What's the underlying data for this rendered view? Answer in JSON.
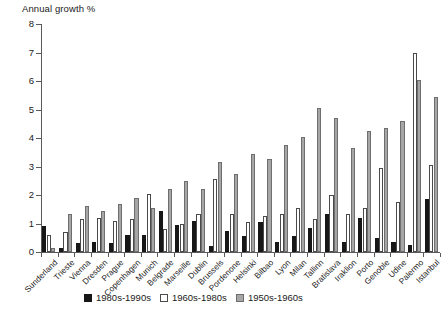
{
  "chart_data": {
    "type": "bar",
    "title": "",
    "ylabel": "Annual growth %",
    "xlabel": "",
    "ylim": [
      0,
      8
    ],
    "yticks": [
      0,
      1,
      2,
      3,
      4,
      5,
      6,
      7,
      8
    ],
    "grid": false,
    "legend_position": "bottom-center",
    "categories": [
      "Sunderland",
      "Trieste",
      "Vienna",
      "Dresden",
      "Prague",
      "Copenhagen",
      "Munich",
      "Belgrade",
      "Marseille",
      "Dublin",
      "Brussels",
      "Pordenone",
      "Helsinki",
      "Bilbao",
      "Lyon",
      "Milan",
      "Tallinn",
      "Bratislava",
      "Iraklion",
      "Porto",
      "Genoble",
      "Udine",
      "Palermo",
      "Istanbul"
    ],
    "series": [
      {
        "name": "1980s-1990s",
        "color": "#171717",
        "values": [
          0.9,
          0.15,
          0.3,
          0.35,
          0.3,
          0.6,
          0.6,
          1.45,
          0.95,
          1.1,
          0.2,
          0.75,
          0.55,
          1.05,
          0.35,
          0.55,
          0.85,
          1.35,
          0.35,
          1.2,
          0.5,
          0.35,
          0.25,
          1.85
        ]
      },
      {
        "name": "1960s-1980s",
        "color": "#ffffff",
        "values": [
          0.6,
          0.7,
          1.15,
          1.2,
          1.1,
          1.15,
          2.05,
          0.8,
          1.0,
          1.35,
          2.55,
          1.35,
          1.05,
          1.25,
          1.35,
          1.55,
          1.15,
          2.0,
          1.35,
          1.55,
          2.95,
          1.75,
          7.0,
          3.05
        ]
      },
      {
        "name": "1950s-1960s",
        "color": "#a6a6a6",
        "values": [
          0.15,
          1.35,
          1.6,
          1.45,
          1.7,
          1.9,
          1.55,
          2.2,
          2.5,
          2.2,
          3.15,
          2.75,
          3.45,
          3.25,
          3.75,
          4.05,
          5.05,
          4.7,
          3.65,
          4.25,
          4.35,
          4.6,
          6.05,
          5.45
        ]
      }
    ]
  },
  "legend": {
    "items": [
      {
        "label": "1980s-1990s",
        "swatch": "black-square-icon"
      },
      {
        "label": "1960s-1980s",
        "swatch": "white-square-icon"
      },
      {
        "label": "1950s-1960s",
        "swatch": "gray-square-icon"
      }
    ]
  }
}
